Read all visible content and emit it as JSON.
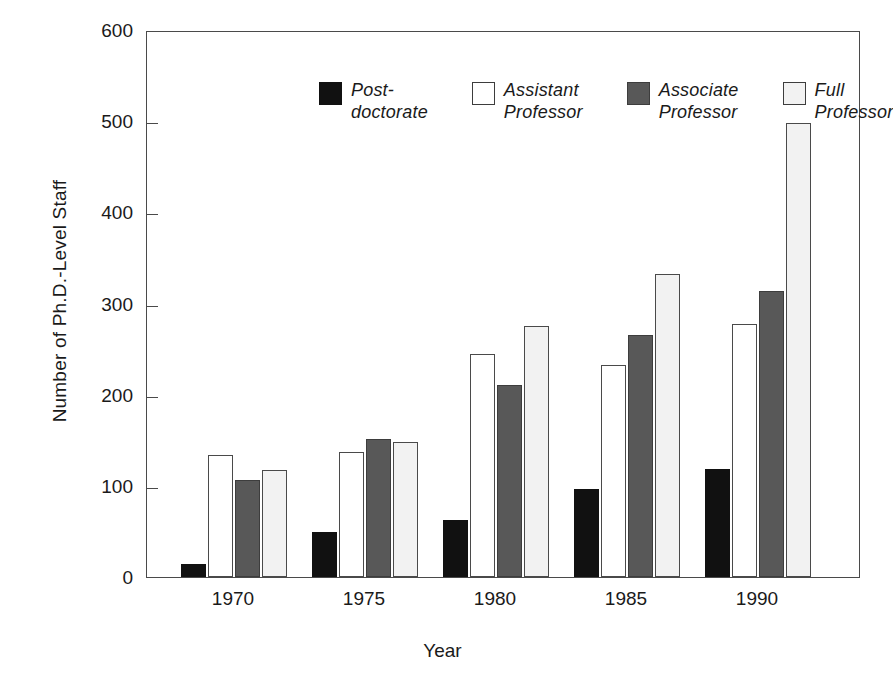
{
  "chart_data": {
    "type": "bar",
    "title": "",
    "xlabel": "Year",
    "ylabel": "Number of Ph.D.-Level Staff",
    "categories": [
      "1970",
      "1975",
      "1980",
      "1985",
      "1990"
    ],
    "series": [
      {
        "name": "Post-doctorate",
        "label_lines": "Post-\ndoctorate",
        "color": "#111111",
        "values": [
          14,
          49,
          63,
          96,
          119
        ]
      },
      {
        "name": "Assistant Professor",
        "label_lines": "Assistant\nProfessor",
        "color": "#ffffff",
        "values": [
          134,
          137,
          245,
          233,
          278
        ]
      },
      {
        "name": "Associate Professor",
        "label_lines": "Associate\nProfessor",
        "color": "#585858",
        "values": [
          106,
          151,
          211,
          265,
          314
        ]
      },
      {
        "name": "Full Professor",
        "label_lines": "Full\nProfessor",
        "color": "#f2f2f2",
        "values": [
          117,
          148,
          275,
          332,
          498
        ]
      }
    ],
    "ylim": [
      0,
      600
    ],
    "yticks": [
      0,
      100,
      200,
      300,
      400,
      500,
      600
    ],
    "ytick_labels": [
      "0",
      "100",
      "200",
      "300",
      "400",
      "500",
      "600"
    ],
    "grid": false,
    "legend_position": "top-inside"
  }
}
